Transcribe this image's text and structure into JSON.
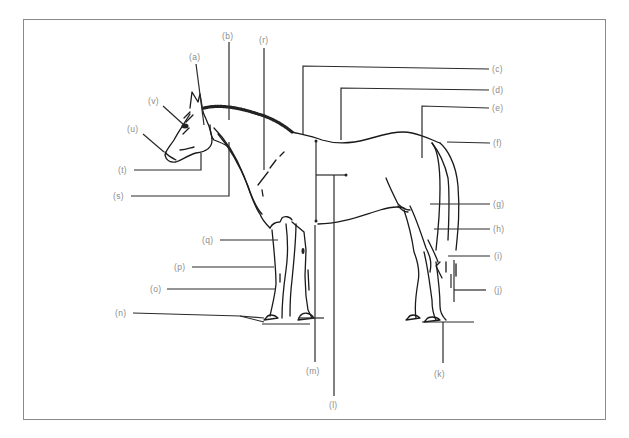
{
  "diagram": {
    "labels": {
      "a": "(a)",
      "b": "(b)",
      "c": "(c)",
      "d": "(d)",
      "e": "(e)",
      "f": "(f)",
      "g": "(g)",
      "h": "(h)",
      "i": "(i)",
      "j": "(j)",
      "k": "(k)",
      "l": "(l)",
      "m": "(m)",
      "n": "(n)",
      "o": "(o)",
      "p": "(p)",
      "q": "(q)",
      "r": "(r)",
      "s": "(s)",
      "t": "(t)",
      "u": "(u)",
      "v": "(v)"
    },
    "colors": {
      "line": "#1a1a1a",
      "label": "#8c8c8c",
      "frame": "#8a8a8a",
      "background": "#ffffff"
    }
  }
}
